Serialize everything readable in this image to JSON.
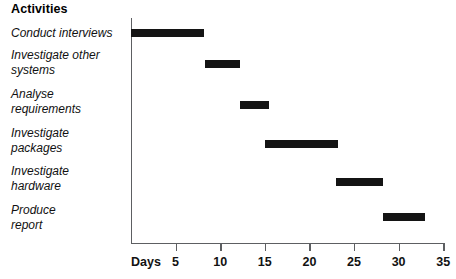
{
  "title": "Activities",
  "axis": {
    "x_name": "Days",
    "ticks": [
      "5",
      "10",
      "15",
      "20",
      "25",
      "30",
      "35"
    ]
  },
  "activities": [
    {
      "label": "Conduct interviews",
      "start": 0,
      "end": 8.2
    },
    {
      "label": "Investigate other\nsystems",
      "start": 8.3,
      "end": 12.2
    },
    {
      "label": "Analyse\nrequirements",
      "start": 12.2,
      "end": 15.5
    },
    {
      "label": "Investigate\npackages",
      "start": 15.0,
      "end": 23.2
    },
    {
      "label": "Investigate\nhardware",
      "start": 23.0,
      "end": 28.2
    },
    {
      "label": "Produce\nreport",
      "start": 28.2,
      "end": 33.0
    }
  ],
  "chart_data": {
    "type": "bar",
    "title": "Activities",
    "xlabel": "Days",
    "ylabel": "Activities",
    "xlim": [
      0,
      35
    ],
    "xticks": [
      5,
      10,
      15,
      20,
      25,
      30,
      35
    ],
    "grid": false,
    "legend": "none",
    "orientation": "horizontal",
    "subtype": "gantt",
    "categories": [
      "Conduct interviews",
      "Investigate other systems",
      "Analyse requirements",
      "Investigate packages",
      "Investigate hardware",
      "Produce report"
    ],
    "series": [
      {
        "name": "Duration (days)",
        "color": "#141414",
        "bars": [
          {
            "category": "Conduct interviews",
            "start": 0,
            "end": 8.2,
            "duration": 8.2
          },
          {
            "category": "Investigate other systems",
            "start": 8.3,
            "end": 12.2,
            "duration": 3.9
          },
          {
            "category": "Analyse requirements",
            "start": 12.2,
            "end": 15.5,
            "duration": 3.3
          },
          {
            "category": "Investigate packages",
            "start": 15.0,
            "end": 23.2,
            "duration": 8.2
          },
          {
            "category": "Investigate hardware",
            "start": 23.0,
            "end": 28.2,
            "duration": 5.2
          },
          {
            "category": "Produce report",
            "start": 28.2,
            "end": 33.0,
            "duration": 4.8
          }
        ]
      }
    ]
  },
  "geometry": {
    "x0_px": 131,
    "px_per_day": 8.92,
    "row_y_px": [
      29,
      60,
      101,
      140,
      178,
      213
    ],
    "label_y_px": [
      26,
      48,
      87,
      126,
      164,
      203
    ]
  }
}
